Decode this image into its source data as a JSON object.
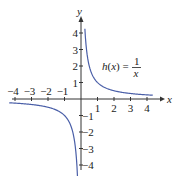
{
  "chart_data": {
    "type": "line",
    "title": "",
    "function": "h(x) = 1/x",
    "annotation": {
      "lhs": "h(x) =",
      "numerator": "1",
      "denominator": "x"
    },
    "xlabel": "x",
    "ylabel": "y",
    "xlim": [
      -4.3,
      4.5
    ],
    "ylim": [
      -4.5,
      4.5
    ],
    "x_ticks": [
      -4,
      -3,
      -2,
      -1,
      1,
      2,
      3,
      4
    ],
    "x_tick_labels": [
      "−4",
      "−3",
      "−2",
      "−1",
      "1",
      "2",
      "3",
      "4"
    ],
    "y_ticks": [
      -4,
      -3,
      -2,
      -1,
      1,
      2,
      3,
      4
    ],
    "y_tick_labels": [
      "−4",
      "−3",
      "−2",
      "−1",
      "1",
      "2",
      "3",
      "4"
    ],
    "grid": false,
    "series": [
      {
        "name": "h(x) = 1/x (x > 0)",
        "x": [
          0.24,
          0.3,
          0.4,
          0.5,
          0.75,
          1,
          1.5,
          2,
          2.5,
          3,
          3.5,
          4,
          4.3
        ],
        "values": [
          4.17,
          3.33,
          2.5,
          2,
          1.33,
          1,
          0.67,
          0.5,
          0.4,
          0.33,
          0.29,
          0.25,
          0.23
        ]
      },
      {
        "name": "h(x) = 1/x (x < 0)",
        "x": [
          -4.3,
          -4,
          -3.5,
          -3,
          -2.5,
          -2,
          -1.5,
          -1,
          -0.75,
          -0.5,
          -0.4,
          -0.3,
          -0.22
        ],
        "values": [
          -0.23,
          -0.25,
          -0.29,
          -0.33,
          -0.4,
          -0.5,
          -0.67,
          -1,
          -1.33,
          -2,
          -2.5,
          -3.33,
          -4.5
        ]
      }
    ],
    "colors": {
      "curve": "#4a5fa8",
      "axis": "#333333"
    }
  }
}
